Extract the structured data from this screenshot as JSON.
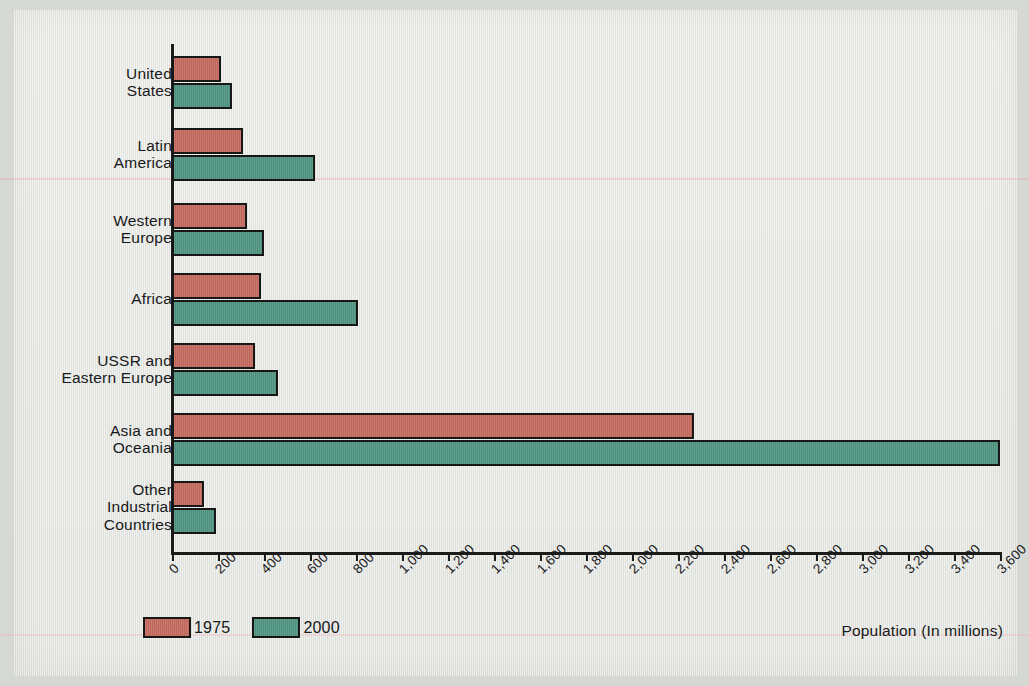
{
  "chart_data": {
    "type": "bar",
    "orientation": "horizontal",
    "title": "",
    "xlabel": "Population (In millions)",
    "ylabel": "",
    "xlim": [
      0,
      3600
    ],
    "xtick_step": 200,
    "grid": false,
    "legend_position": "bottom-left",
    "categories": [
      "United\nStates",
      "Latin\nAmerica",
      "Western\nEurope",
      "Africa",
      "USSR and\nEastern Europe",
      "Asia and\nOceania",
      "Other\nIndustrial\nCountries"
    ],
    "tick_labels": [
      "0",
      "200",
      "400",
      "600",
      "800",
      "1,000",
      "1,200",
      "1,400",
      "1,600",
      "1,800",
      "2,000",
      "2,200",
      "2,400",
      "2,600",
      "2,800",
      "3,000",
      "3,200",
      "3,400",
      "3,600"
    ],
    "tick_values": [
      0,
      200,
      400,
      600,
      800,
      1000,
      1200,
      1400,
      1600,
      1800,
      2000,
      2200,
      2400,
      2600,
      2800,
      3000,
      3200,
      3400,
      3600
    ],
    "series": [
      {
        "name": "1975",
        "color": "#c4695e",
        "values": [
          215,
          310,
          325,
          385,
          360,
          2270,
          140
        ]
      },
      {
        "name": "2000",
        "color": "#4e9480",
        "values": [
          260,
          620,
          400,
          810,
          460,
          3600,
          190
        ]
      }
    ]
  },
  "legend": {
    "items": [
      {
        "label": "1975"
      },
      {
        "label": "2000"
      }
    ]
  },
  "axis": {
    "x_title": "Population (In millions)"
  }
}
